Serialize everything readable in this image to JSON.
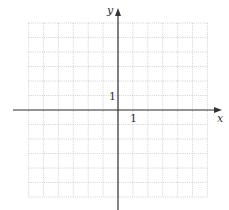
{
  "diagram": {
    "type": "coordinate-grid",
    "axes": {
      "x_label": "x",
      "y_label": "y",
      "x_tick_label": "1",
      "y_tick_label": "1"
    },
    "grid": {
      "cols_left": 6,
      "cols_right": 6,
      "rows_above": 6,
      "rows_below": 6,
      "unit": 1,
      "line_style": "dotted"
    },
    "colors": {
      "axis": "#333333",
      "grid": "#bfbfbf",
      "background": "#ffffff"
    }
  }
}
